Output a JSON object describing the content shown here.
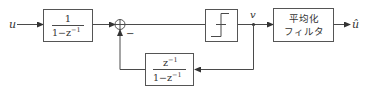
{
  "diagram": {
    "type": "block-diagram",
    "input": {
      "label": "u"
    },
    "output": {
      "label": "û"
    },
    "blocks": [
      {
        "id": "integrator",
        "numerator": "1",
        "denominator_prefix": "1−z",
        "denominator_exp": "−1"
      },
      {
        "id": "quantizer",
        "symbol": "step-function"
      },
      {
        "id": "averaging-filter",
        "line1": "平均化",
        "line2": "フィルタ"
      },
      {
        "id": "feedback",
        "numerator_base": "z",
        "numerator_exp": "−1",
        "denominator_prefix": "1−z",
        "denominator_exp": "−1"
      }
    ],
    "summing_junction": {
      "feedback_sign": "−"
    },
    "node": {
      "label": "v"
    }
  },
  "colors": {
    "line": "#4a4a4a",
    "background": "#ffffff"
  }
}
